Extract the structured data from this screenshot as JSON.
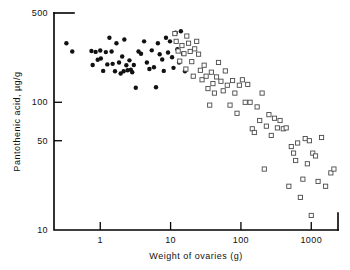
{
  "chart_data": {
    "type": "scatter",
    "title": "",
    "xlabel": "Weight of ovaries (g)",
    "ylabel": "Pantothenic acid, µg/g",
    "xscale": "log",
    "yscale": "log",
    "xlim": [
      0.22,
      2400
    ],
    "ylim": [
      10,
      500
    ],
    "xticks": [
      1,
      10,
      100,
      1000
    ],
    "xtick_labels": [
      "1",
      "10",
      "100",
      "1000"
    ],
    "yticks": [
      10,
      50,
      100,
      500
    ],
    "ytick_labels": [
      "10",
      "50",
      "100",
      "500"
    ],
    "grid": false,
    "legend": "none",
    "series": [
      {
        "name": "filled-circles",
        "marker": "filled-circle",
        "color": "#111111",
        "points": [
          [
            0.33,
            290
          ],
          [
            0.4,
            250
          ],
          [
            0.75,
            252
          ],
          [
            0.78,
            196
          ],
          [
            0.86,
            248
          ],
          [
            0.92,
            215
          ],
          [
            1.0,
            254
          ],
          [
            1.02,
            220
          ],
          [
            1.1,
            176
          ],
          [
            1.2,
            247
          ],
          [
            1.26,
            198
          ],
          [
            1.35,
            320
          ],
          [
            1.45,
            250
          ],
          [
            1.5,
            200
          ],
          [
            1.62,
            175
          ],
          [
            1.7,
            290
          ],
          [
            1.85,
            205
          ],
          [
            1.95,
            168
          ],
          [
            2.05,
            228
          ],
          [
            2.15,
            175
          ],
          [
            2.2,
            310
          ],
          [
            2.35,
            195
          ],
          [
            2.45,
            178
          ],
          [
            2.6,
            213
          ],
          [
            2.72,
            180
          ],
          [
            2.85,
            172
          ],
          [
            3.0,
            196
          ],
          [
            3.2,
            130
          ],
          [
            3.5,
            250
          ],
          [
            3.8,
            240
          ],
          [
            4.2,
            300
          ],
          [
            4.6,
            205
          ],
          [
            5.0,
            182
          ],
          [
            5.4,
            255
          ],
          [
            5.8,
            188
          ],
          [
            6.2,
            131
          ],
          [
            6.6,
            290
          ],
          [
            7.0,
            238
          ],
          [
            7.6,
            216
          ],
          [
            8.0,
            176
          ],
          [
            8.6,
            320
          ],
          [
            9.2,
            245
          ],
          [
            9.8,
            300
          ],
          [
            10.5,
            225
          ],
          [
            11.0,
            186
          ],
          [
            11.8,
            350
          ],
          [
            12.5,
            260
          ],
          [
            13.2,
            205
          ],
          [
            14.0,
            360
          ],
          [
            15.0,
            240
          ],
          [
            16.0,
            175
          ]
        ]
      },
      {
        "name": "open-squares",
        "marker": "open-square",
        "color": "#4a4a4a",
        "points": [
          [
            11.5,
            345
          ],
          [
            12.0,
            300
          ],
          [
            12.8,
            252
          ],
          [
            13.5,
            210
          ],
          [
            14.5,
            278
          ],
          [
            15.5,
            240
          ],
          [
            16.5,
            182
          ],
          [
            17.0,
            330
          ],
          [
            18.0,
            290
          ],
          [
            19.0,
            250
          ],
          [
            20.0,
            208
          ],
          [
            21.0,
            160
          ],
          [
            22.0,
            262
          ],
          [
            23.5,
            300
          ],
          [
            25.0,
            238
          ],
          [
            26.5,
            178
          ],
          [
            28.0,
            150
          ],
          [
            30.0,
            195
          ],
          [
            32.0,
            160
          ],
          [
            34.0,
            128
          ],
          [
            36.0,
            95
          ],
          [
            38.0,
            172
          ],
          [
            40.0,
            140
          ],
          [
            42.0,
            118
          ],
          [
            45.0,
            158
          ],
          [
            48.0,
            205
          ],
          [
            52.0,
            146
          ],
          [
            56.0,
            123
          ],
          [
            60.0,
            176
          ],
          [
            64.0,
            136
          ],
          [
            70.0,
            95
          ],
          [
            76.0,
            148
          ],
          [
            82.0,
            118
          ],
          [
            88.0,
            82
          ],
          [
            95.0,
            136
          ],
          [
            105.0,
            150
          ],
          [
            115.0,
            100
          ],
          [
            125.0,
            138
          ],
          [
            135.0,
            100
          ],
          [
            145.0,
            62
          ],
          [
            155.0,
            58
          ],
          [
            170.0,
            92
          ],
          [
            185.0,
            72
          ],
          [
            200.0,
            118
          ],
          [
            215.0,
            30
          ],
          [
            230.0,
            65
          ],
          [
            250.0,
            80
          ],
          [
            270.0,
            55
          ],
          [
            300.0,
            75
          ],
          [
            330.0,
            63
          ],
          [
            360.0,
            72
          ],
          [
            400.0,
            62
          ],
          [
            440.0,
            63
          ],
          [
            480.0,
            22
          ],
          [
            520.0,
            45
          ],
          [
            560.0,
            40
          ],
          [
            600.0,
            35
          ],
          [
            640.0,
            48
          ],
          [
            700.0,
            18
          ],
          [
            760.0,
            25
          ],
          [
            820.0,
            52
          ],
          [
            880.0,
            33
          ],
          [
            940.0,
            50
          ],
          [
            1000.0,
            13
          ],
          [
            1050.0,
            40
          ],
          [
            1150.0,
            38
          ],
          [
            1250.0,
            24
          ],
          [
            1400.0,
            53
          ],
          [
            1600.0,
            22
          ],
          [
            1900.0,
            28
          ],
          [
            2100.0,
            30
          ]
        ]
      }
    ]
  }
}
